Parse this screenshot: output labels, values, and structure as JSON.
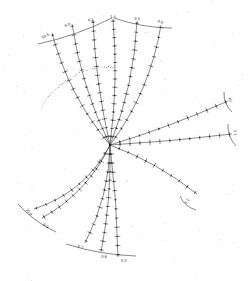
{
  "figure": {
    "background_color": "#fefefe",
    "ink_color": "#2b2b2b",
    "center": {
      "x": 110,
      "y": 145
    }
  },
  "chart_data": {
    "type": "line",
    "title": "",
    "subtitle": "",
    "xlabel": "",
    "ylabel": "",
    "layout": "radial star / nomogram, curved axes radiating from a common origin",
    "grid": false,
    "legend": "none",
    "origin": {
      "x": 110,
      "y": 145
    },
    "series": [
      {
        "name": "ray-1",
        "label": "10.6",
        "label_x": 46,
        "label_y": 37,
        "angle_deg": 208,
        "length": 118,
        "tick_count": 13,
        "curvature": -14,
        "end_x": 52,
        "end_y": 33
      },
      {
        "name": "ray-2",
        "label": "6.0",
        "label_x": 68,
        "label_y": 26,
        "angle_deg": 222,
        "length": 124,
        "tick_count": 14,
        "curvature": -10,
        "end_x": 72,
        "end_y": 24
      },
      {
        "name": "ray-3",
        "label": "6.1",
        "label_x": 91,
        "label_y": 21,
        "angle_deg": 238,
        "length": 126,
        "tick_count": 14,
        "curvature": -6,
        "end_x": 93,
        "end_y": 20
      },
      {
        "name": "ray-4",
        "label": "1.0",
        "label_x": 113,
        "label_y": 18,
        "angle_deg": 268,
        "length": 127,
        "tick_count": 15,
        "curvature": 7,
        "end_x": 113,
        "end_y": 19
      },
      {
        "name": "ray-5",
        "label": "5.6",
        "label_x": 137,
        "label_y": 20,
        "angle_deg": 282,
        "length": 128,
        "tick_count": 14,
        "curvature": 11,
        "end_x": 137,
        "end_y": 21
      },
      {
        "name": "ray-6",
        "label": "9.0",
        "label_x": 160,
        "label_y": 23,
        "angle_deg": 296,
        "length": 126,
        "tick_count": 13,
        "curvature": 16,
        "end_x": 161,
        "end_y": 25
      },
      {
        "name": "ray-7",
        "label": "10",
        "label_x": 229,
        "label_y": 100,
        "angle_deg": 338,
        "length": 122,
        "tick_count": 12,
        "curvature": 4,
        "end_x": 228,
        "end_y": 101
      },
      {
        "name": "ray-8",
        "label": "2.1",
        "label_x": 234,
        "label_y": 133,
        "angle_deg": 351,
        "length": 124,
        "tick_count": 12,
        "curvature": 2,
        "end_x": 232,
        "end_y": 134
      },
      {
        "name": "ray-9",
        "label": "1.2",
        "label_x": 188,
        "label_y": 202,
        "angle_deg": 30,
        "length": 101,
        "tick_count": 10,
        "curvature": -8,
        "end_x": 197,
        "end_y": 194
      },
      {
        "name": "ray-10",
        "label": "5.3",
        "label_x": 124,
        "label_y": 262,
        "angle_deg": 86,
        "length": 113,
        "tick_count": 12,
        "curvature": -3,
        "end_x": 118,
        "end_y": 257
      },
      {
        "name": "ray-11",
        "label": "0.8",
        "label_x": 104,
        "label_y": 258,
        "angle_deg": 94,
        "length": 108,
        "tick_count": 12,
        "curvature": -6,
        "end_x": 101,
        "end_y": 252
      },
      {
        "name": "ray-12",
        "label": "5.7",
        "label_x": 80,
        "label_y": 248,
        "angle_deg": 108,
        "length": 102,
        "tick_count": 11,
        "curvature": -12,
        "end_x": 85,
        "end_y": 243
      },
      {
        "name": "ray-13",
        "label": "0.9",
        "label_x": 45,
        "label_y": 227,
        "angle_deg": 137,
        "length": 98,
        "tick_count": 11,
        "curvature": -16,
        "end_x": 42,
        "end_y": 218
      },
      {
        "name": "ray-14",
        "label": "20.9",
        "label_x": 28,
        "label_y": 213,
        "angle_deg": 146,
        "length": 94,
        "tick_count": 10,
        "curvature": -20,
        "end_x": 34,
        "end_y": 209
      }
    ],
    "scale_bars": [
      {
        "name": "top-left-bar",
        "x1": 38,
        "y1": 44,
        "x2": 112,
        "y2": 18
      },
      {
        "name": "top-right-bar",
        "x1": 114,
        "y1": 18,
        "x2": 172,
        "y2": 28
      },
      {
        "name": "right-upper-bar",
        "x1": 224,
        "y1": 92,
        "x2": 232,
        "y2": 112
      },
      {
        "name": "right-lower-bar",
        "x1": 228,
        "y1": 124,
        "x2": 236,
        "y2": 146
      },
      {
        "name": "bottom-right-bar",
        "x1": 180,
        "y1": 196,
        "x2": 196,
        "y2": 210
      },
      {
        "name": "bottom-bar",
        "x1": 66,
        "y1": 244,
        "x2": 136,
        "y2": 256
      },
      {
        "name": "bottom-left-bar",
        "x1": 18,
        "y1": 204,
        "x2": 56,
        "y2": 232
      }
    ],
    "values_read": [
      "10.6",
      "6.0",
      "6.1",
      "1.0",
      "5.6",
      "9.0",
      "10",
      "2.1",
      "1.2",
      "5.3",
      "0.8",
      "5.7",
      "0.9",
      "20.9"
    ]
  },
  "colors": {
    "ink": "#2b2b2b",
    "paper": "#fefefe",
    "speck": "#8f8f8f"
  }
}
